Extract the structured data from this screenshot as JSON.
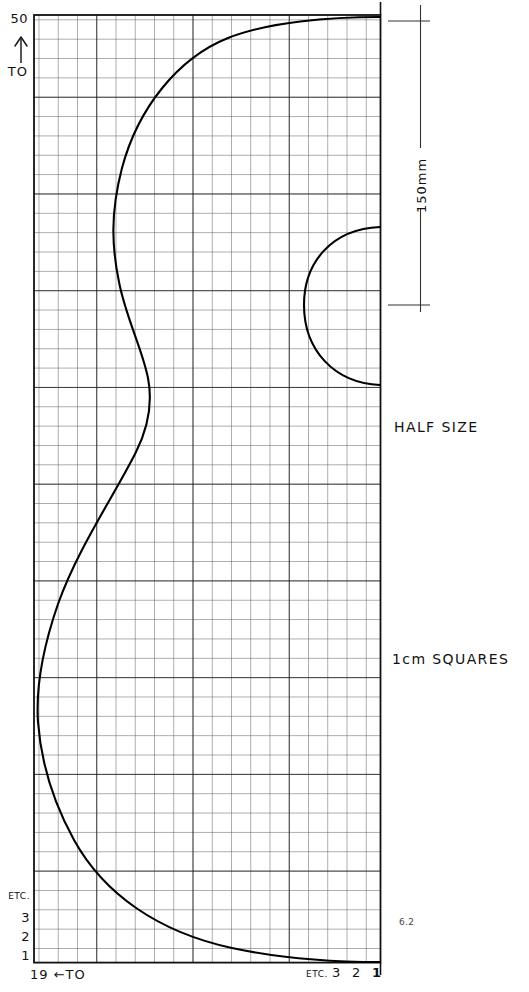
{
  "figure": {
    "number": "6.2",
    "description_notes": [
      "HALF SIZE",
      "1cm SQUARES"
    ]
  },
  "vertical_axis": {
    "top_value": "50",
    "arrow_icon": "up-arrow-icon",
    "to_label": "TO",
    "bottom_labels": [
      "ETC.",
      "3",
      "2",
      "1"
    ]
  },
  "horizontal_axis": {
    "left_label_value": "19",
    "left_label_arrow": "←",
    "left_label_to": "TO",
    "left_label_full": "19 ←TO",
    "right_labels": [
      "ETC.",
      "3",
      "2",
      "1"
    ]
  },
  "dimension": {
    "label": "150mm",
    "orientation": "vertical",
    "upper_tick_y": 21,
    "lower_tick_y": 305
  },
  "notes": {
    "scale_note": "HALF SIZE",
    "grid_note": "1cm SQUARES"
  },
  "grid": {
    "cell_label": "1cm SQUARES",
    "left": 34,
    "top": 15,
    "right": 380,
    "bottom": 963,
    "cell_size": 19.25,
    "columns": 18,
    "rows": 49,
    "minor_color": "#3a3a3a",
    "major_color": "#111111",
    "major_every": 5
  },
  "chart_data": {
    "type": "line",
    "xlabel": "19 ←TO",
    "ylabel": "50 ↑ TO",
    "grid": true,
    "legend": "none",
    "curves": [
      {
        "name": "main-profile-curve",
        "path": "M 380 17 C 330 17 268 22 228 38 C 178 58 138 108 122 168 C 110 214 112 248 119 282 C 126 318 142 348 148 378 C 153 404 148 428 136 452 C 114 496 78 548 58 604 C 40 656 36 692 38 722 C 41 762 52 800 74 840 C 104 894 158 932 232 948 C 288 960 340 962 380 962"
      },
      {
        "name": "semicircle-arc",
        "path": "M 380 227 C 332 229 304 262 304 305 C 304 350 334 383 380 385"
      }
    ],
    "annotations": [
      {
        "text": "150mm",
        "type": "dimension",
        "x": 420,
        "y": 185
      },
      {
        "text": "HALF SIZE",
        "type": "note",
        "x": 395,
        "y": 428
      },
      {
        "text": "1cm SQUARES",
        "type": "note",
        "x": 393,
        "y": 660
      },
      {
        "text": "6.2",
        "type": "figure-number",
        "x": 400,
        "y": 922
      }
    ]
  }
}
